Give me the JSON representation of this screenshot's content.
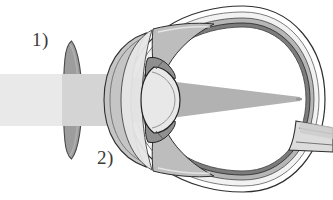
{
  "figure": {
    "background_color": "#ffffff",
    "width": 333,
    "height": 200
  },
  "labels": [
    {
      "id": "label-1",
      "text": "1)",
      "refers_to": "spectacle-lens",
      "x": 32,
      "y": 30
    },
    {
      "id": "label-2",
      "text": "2)",
      "refers_to": "cornea",
      "x": 97,
      "y": 148
    }
  ],
  "colors": {
    "outline": "#2b2b2b",
    "sclera_fill": "#ffffff",
    "sclera_shade": "#d8d8d8",
    "choroid_shade": "#8f8f8f",
    "retina_shade": "#5e5e5e",
    "vitreous_fill": "#ffffff",
    "beam_incoming": "#e6e6e6",
    "beam_refracted": "#d2d2d2",
    "beam_internal": "#b3b3b3",
    "spectacle_lens_fill": "#9c9c9c",
    "spectacle_lens_edge": "#707070",
    "cornea_fill": "#c9c9c9",
    "crystalline_lens_fill": "#e3e3e3",
    "iris_fill": "#9a9a9a",
    "optic_nerve_fill": "#d5d5d5"
  },
  "parts": {
    "spectacle_lens": {
      "name": "Spectacle (corrective) lens",
      "shape": "concave meniscus",
      "label": "1)"
    },
    "cornea": {
      "name": "Cornea",
      "shape": "anterior crescent dome",
      "label": "2)"
    },
    "iris": {
      "name": "Iris",
      "shape": "paired wedges above and below pupil"
    },
    "crystalline_lens": {
      "name": "Crystalline lens",
      "shape": "biconvex"
    },
    "sclera": {
      "name": "Sclera",
      "shape": "outer globe wall"
    },
    "choroid": {
      "name": "Choroid",
      "shape": "middle globe layer"
    },
    "retina": {
      "name": "Retina",
      "shape": "inner globe layer"
    },
    "vitreous": {
      "name": "Vitreous body",
      "shape": "globe interior"
    },
    "optic_nerve": {
      "name": "Optic nerve",
      "shape": "posterior stalk, lower right"
    }
  },
  "light_path": {
    "description": "Parallel light enters from the left, is spread by the concave spectacle lens, refracted by cornea and crystalline lens, and converges to a focal point on the retina.",
    "entry_side": "left",
    "focus_location": "retina (posterior pole)",
    "focus_x": 296,
    "focus_y": 99
  }
}
